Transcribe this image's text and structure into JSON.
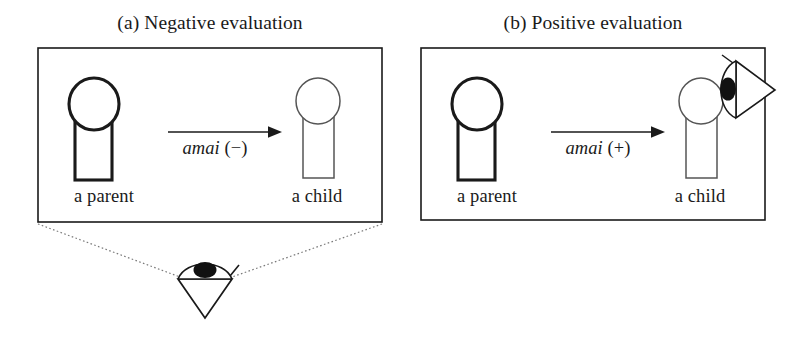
{
  "figure": {
    "background_color": "#ffffff",
    "ink_color": "#1a1a1a",
    "panels": [
      {
        "id": "a",
        "title": "(a) Negative evaluation",
        "relation": {
          "term": "amai",
          "value": "(−)"
        },
        "actors": [
          {
            "role": "parent",
            "label": "a parent",
            "emphasis": "bold"
          },
          {
            "role": "child",
            "label": "a child",
            "emphasis": "thin"
          }
        ],
        "observer": {
          "name": "eye-symbol",
          "position": "below-panel",
          "gaze": "upward-at-whole-scene"
        }
      },
      {
        "id": "b",
        "title": "(b) Positive evaluation",
        "relation": {
          "term": "amai",
          "value": "(+)"
        },
        "actors": [
          {
            "role": "parent",
            "label": "a parent",
            "emphasis": "bold"
          },
          {
            "role": "child",
            "label": "a child",
            "emphasis": "thin"
          }
        ],
        "observer": {
          "name": "eye-symbol",
          "position": "beside-child",
          "gaze": "rightward"
        }
      }
    ]
  }
}
